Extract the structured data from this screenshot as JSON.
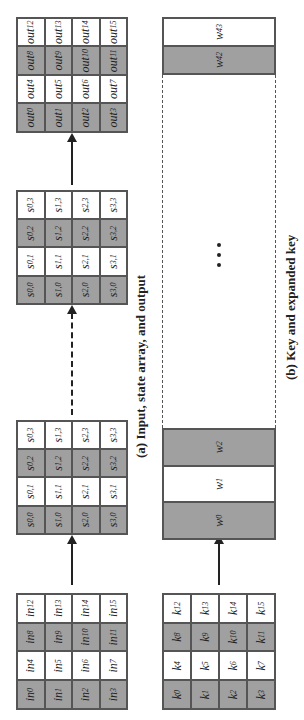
{
  "colors": {
    "shade": "#a0a0a0",
    "light": "#ffffff",
    "border": "#555555",
    "ink": "#222222"
  },
  "section_a": {
    "caption": "(a) Input, state array, and output",
    "input_grid": {
      "label_prefix": "in",
      "rows": [
        [
          {
            "b": "in",
            "s": "0"
          },
          {
            "b": "in",
            "s": "4"
          },
          {
            "b": "in",
            "s": "8"
          },
          {
            "b": "in",
            "s": "12"
          }
        ],
        [
          {
            "b": "in",
            "s": "1"
          },
          {
            "b": "in",
            "s": "5"
          },
          {
            "b": "in",
            "s": "9"
          },
          {
            "b": "in",
            "s": "13"
          }
        ],
        [
          {
            "b": "in",
            "s": "2"
          },
          {
            "b": "in",
            "s": "6"
          },
          {
            "b": "in",
            "s": "10"
          },
          {
            "b": "in",
            "s": "14"
          }
        ],
        [
          {
            "b": "in",
            "s": "3"
          },
          {
            "b": "in",
            "s": "7"
          },
          {
            "b": "in",
            "s": "11"
          },
          {
            "b": "in",
            "s": "15"
          }
        ]
      ]
    },
    "state_grid_1": {
      "rows": [
        [
          {
            "b": "s",
            "s": "0,0"
          },
          {
            "b": "s",
            "s": "0,1"
          },
          {
            "b": "s",
            "s": "0,2"
          },
          {
            "b": "s",
            "s": "0,3"
          }
        ],
        [
          {
            "b": "s",
            "s": "1,0"
          },
          {
            "b": "s",
            "s": "1,1"
          },
          {
            "b": "s",
            "s": "1,2"
          },
          {
            "b": "s",
            "s": "1,3"
          }
        ],
        [
          {
            "b": "s",
            "s": "2,0"
          },
          {
            "b": "s",
            "s": "2,1"
          },
          {
            "b": "s",
            "s": "2,2"
          },
          {
            "b": "s",
            "s": "2,3"
          }
        ],
        [
          {
            "b": "s",
            "s": "3,0"
          },
          {
            "b": "s",
            "s": "3,1"
          },
          {
            "b": "s",
            "s": "3,2"
          },
          {
            "b": "s",
            "s": "3,3"
          }
        ]
      ]
    },
    "state_grid_2": {
      "rows": [
        [
          {
            "b": "s",
            "s": "0,0"
          },
          {
            "b": "s",
            "s": "0,1"
          },
          {
            "b": "s",
            "s": "0,2"
          },
          {
            "b": "s",
            "s": "0,3"
          }
        ],
        [
          {
            "b": "s",
            "s": "1,0"
          },
          {
            "b": "s",
            "s": "1,1"
          },
          {
            "b": "s",
            "s": "1,2"
          },
          {
            "b": "s",
            "s": "1,3"
          }
        ],
        [
          {
            "b": "s",
            "s": "2,0"
          },
          {
            "b": "s",
            "s": "2,1"
          },
          {
            "b": "s",
            "s": "2,2"
          },
          {
            "b": "s",
            "s": "2,3"
          }
        ],
        [
          {
            "b": "s",
            "s": "3,0"
          },
          {
            "b": "s",
            "s": "3,1"
          },
          {
            "b": "s",
            "s": "3,2"
          },
          {
            "b": "s",
            "s": "3,3"
          }
        ]
      ]
    },
    "output_grid": {
      "rows": [
        [
          {
            "b": "out",
            "s": "0"
          },
          {
            "b": "out",
            "s": "4"
          },
          {
            "b": "out",
            "s": "8"
          },
          {
            "b": "out",
            "s": "12"
          }
        ],
        [
          {
            "b": "out",
            "s": "1"
          },
          {
            "b": "out",
            "s": "5"
          },
          {
            "b": "out",
            "s": "9"
          },
          {
            "b": "out",
            "s": "13"
          }
        ],
        [
          {
            "b": "out",
            "s": "2"
          },
          {
            "b": "out",
            "s": "6"
          },
          {
            "b": "out",
            "s": "10"
          },
          {
            "b": "out",
            "s": "14"
          }
        ],
        [
          {
            "b": "out",
            "s": "3"
          },
          {
            "b": "out",
            "s": "7"
          },
          {
            "b": "out",
            "s": "11"
          },
          {
            "b": "out",
            "s": "15"
          }
        ]
      ]
    },
    "arrows": [
      "solid",
      "dashed",
      "solid"
    ]
  },
  "section_b": {
    "caption": "(b) Key and expanded key",
    "key_grid": {
      "rows": [
        [
          {
            "b": "k",
            "s": "0"
          },
          {
            "b": "k",
            "s": "4"
          },
          {
            "b": "k",
            "s": "8"
          },
          {
            "b": "k",
            "s": "12"
          }
        ],
        [
          {
            "b": "k",
            "s": "1"
          },
          {
            "b": "k",
            "s": "5"
          },
          {
            "b": "k",
            "s": "9"
          },
          {
            "b": "k",
            "s": "13"
          }
        ],
        [
          {
            "b": "k",
            "s": "2"
          },
          {
            "b": "k",
            "s": "6"
          },
          {
            "b": "k",
            "s": "10"
          },
          {
            "b": "k",
            "s": "14"
          }
        ],
        [
          {
            "b": "k",
            "s": "3"
          },
          {
            "b": "k",
            "s": "7"
          },
          {
            "b": "k",
            "s": "11"
          },
          {
            "b": "k",
            "s": "15"
          }
        ]
      ]
    },
    "expanded_key_start": [
      {
        "b": "w",
        "s": "0"
      },
      {
        "b": "w",
        "s": "1"
      },
      {
        "b": "w",
        "s": "2"
      }
    ],
    "expanded_key_end": [
      {
        "b": "w",
        "s": "42"
      },
      {
        "b": "w",
        "s": "43"
      }
    ],
    "ellipsis": "• • •"
  }
}
